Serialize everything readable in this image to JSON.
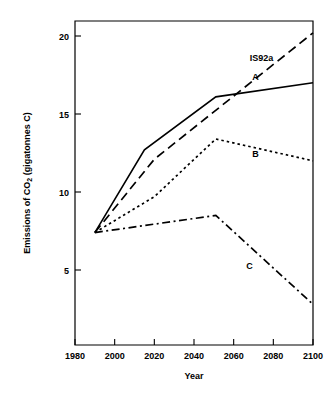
{
  "chart_data": {
    "type": "line",
    "title": "",
    "xlabel": "Year",
    "ylabel": "Emissions of CO2 (gigatonnes C)",
    "ylabel_parts": {
      "prefix": "Emissions of CO",
      "subscript": "2",
      "suffix": " (gigatonnes C)"
    },
    "xlim": [
      1980,
      2100
    ],
    "ylim": [
      0,
      21.0
    ],
    "grid": false,
    "legend_position": "inline-labels",
    "xticks": [
      1980,
      2000,
      2020,
      2040,
      2060,
      2080,
      2100
    ],
    "xtick_labels": [
      "1980",
      "2000",
      "2020",
      "2040",
      "2060",
      "2080",
      "2100"
    ],
    "yticks": [
      5,
      10,
      15,
      20
    ],
    "ytick_labels": [
      "5",
      "10",
      "15",
      "20"
    ],
    "series": [
      {
        "name": "IS92a",
        "label": "IS92a",
        "style": "dashed",
        "label_x": 2074,
        "label_y": 18.6,
        "x": [
          1990,
          2020,
          2100
        ],
        "values": [
          7.4,
          12.1,
          20.2
        ]
      },
      {
        "name": "A",
        "label": "A",
        "style": "solid",
        "label_x": 2071,
        "label_y": 17.4,
        "x": [
          1990,
          2015,
          2051,
          2100
        ],
        "values": [
          7.4,
          12.7,
          16.1,
          17.0
        ]
      },
      {
        "name": "B",
        "label": "B",
        "style": "dotted",
        "label_x": 2071,
        "label_y": 12.45,
        "x": [
          1990,
          2020,
          2051,
          2100
        ],
        "values": [
          7.4,
          9.7,
          13.4,
          12.0
        ]
      },
      {
        "name": "C",
        "label": "C",
        "style": "dashdot",
        "label_x": 2068,
        "label_y": 5.3,
        "x": [
          1990,
          2051,
          2100
        ],
        "values": [
          7.4,
          8.5,
          2.8
        ]
      }
    ],
    "colors": {
      "line": "#000000",
      "background": "#ffffff",
      "text": "#000000"
    }
  }
}
